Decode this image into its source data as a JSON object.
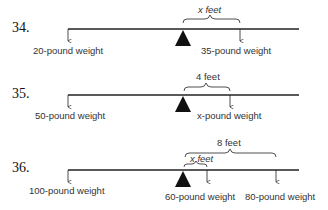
{
  "problems": [
    {
      "number": "34.",
      "left_weight": "20-pound weight",
      "right_weight": "35-pound weight",
      "distance_label": "x feet"
    },
    {
      "number": "35.",
      "left_weight": "50-pound weight",
      "right_weight": "x-pound weight",
      "distance_label": "4 feet"
    },
    {
      "number": "36.",
      "left_weight": "100-pound weight",
      "middle_weight": "60-pound weight",
      "right_weight": "80-pound weight",
      "inner_distance_label": "x feet",
      "outer_distance_label": "8 feet"
    }
  ]
}
